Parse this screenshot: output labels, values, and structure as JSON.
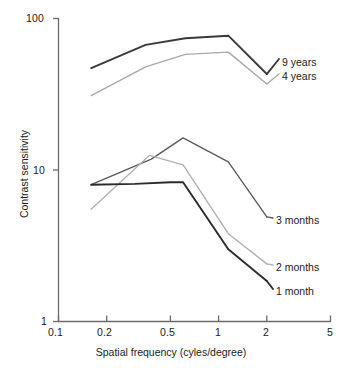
{
  "chart_data": {
    "type": "line",
    "title": "",
    "xlabel": "Spatial frequency (cyles/degree)",
    "ylabel": "Contrast sensitivity",
    "xscale": "log",
    "yscale": "log",
    "xlim": [
      0.1,
      5
    ],
    "ylim": [
      1,
      100
    ],
    "xticks": [
      0.1,
      0.2,
      0.5,
      1,
      2,
      5
    ],
    "xticklabels": [
      "0.1",
      "0.2",
      "0.5",
      "1",
      "2",
      "5"
    ],
    "yticks": [
      1,
      10,
      100
    ],
    "yticklabels": [
      "1",
      "10",
      "100"
    ],
    "grid": false,
    "legend_position": "right-of-curve-ends",
    "series": [
      {
        "name": "9 years",
        "color": "#3a3a3a",
        "label": "9 years",
        "x": [
          0.16,
          0.35,
          0.62,
          1.15,
          2.0
        ],
        "y": [
          47,
          67,
          74,
          77,
          43
        ]
      },
      {
        "name": "4 years",
        "color": "#a8a8a8",
        "label": "4 years",
        "x": [
          0.16,
          0.35,
          0.62,
          1.15,
          2.0
        ],
        "y": [
          31,
          48,
          58,
          60,
          37
        ]
      },
      {
        "name": "3 months",
        "color": "#5a5a5a",
        "label": "3 months",
        "x": [
          0.16,
          0.38,
          0.6,
          1.15,
          2.0
        ],
        "y": [
          8.0,
          11.8,
          16.3,
          11.3,
          4.9
        ]
      },
      {
        "name": "2 months",
        "color": "#b0b0b0",
        "label": "2 months",
        "x": [
          0.16,
          0.37,
          0.6,
          1.15,
          2.0
        ],
        "y": [
          5.5,
          12.5,
          10.8,
          3.8,
          2.4
        ]
      },
      {
        "name": "1 month",
        "color": "#2b2b2b",
        "label": "1 month",
        "x": [
          0.16,
          0.3,
          0.5,
          0.6,
          1.15,
          2.0
        ],
        "y": [
          8.0,
          8.1,
          8.3,
          8.3,
          3.0,
          1.85
        ]
      }
    ]
  },
  "axis": {
    "y_top_label": "100",
    "y_mid_label": "10",
    "y_bottom_label": "1",
    "x_labels": [
      "0.1",
      "0.2",
      "0.5",
      "1",
      "2",
      "5"
    ],
    "x_title": "Spatial frequency (cyles/degree)",
    "y_title": "Contrast sensitivity"
  },
  "labels": {
    "nine_years": "9 years",
    "four_years": "4 years",
    "three_months": "3 months",
    "two_months": "2 months",
    "one_month": "1 month"
  }
}
